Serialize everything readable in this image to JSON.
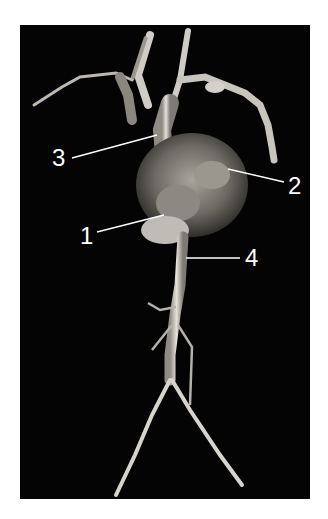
{
  "figure": {
    "background_color": "#040404",
    "vessel_color": "#d9d6cf",
    "labels": [
      {
        "id": "1",
        "text": "1"
      },
      {
        "id": "2",
        "text": "2"
      },
      {
        "id": "3",
        "text": "3"
      },
      {
        "id": "4",
        "text": "4"
      }
    ]
  }
}
